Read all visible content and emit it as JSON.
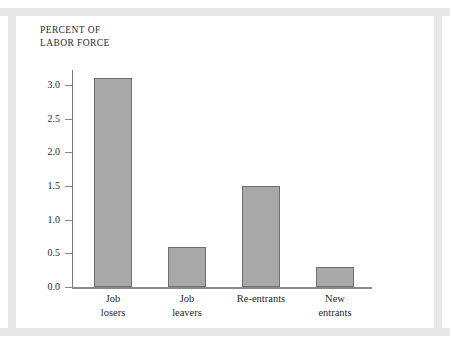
{
  "chart_data": {
    "type": "bar",
    "title": "",
    "ylabel": "PERCENT OF\nLABOR FORCE",
    "xlabel": "",
    "categories": [
      "Job\nlosers",
      "Job\nleavers",
      "Re-entrants",
      "New\nentrants"
    ],
    "values": [
      3.1,
      0.6,
      1.5,
      0.3
    ],
    "ylim": [
      0.0,
      3.25
    ],
    "yticks": [
      "0.0",
      "0.5",
      "1.0",
      "1.5",
      "2.0",
      "2.5",
      "3.0"
    ],
    "ytick_values": [
      0.0,
      0.5,
      1.0,
      1.5,
      2.0,
      2.5,
      3.0
    ],
    "grid": false,
    "legend": null,
    "bar_color": "#a8a8a8",
    "bar_edge_color": "#6e6e6e",
    "axis_color": "#8a8a8a",
    "background_color": "#ffffff",
    "frame_color": "#e8e8e8"
  }
}
